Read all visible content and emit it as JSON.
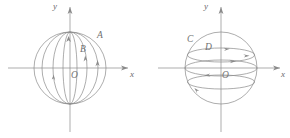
{
  "figure": {
    "background_color": "#ffffff",
    "stroke_color": "#8a8a8a",
    "label_color": "#6f6f6f",
    "panels": [
      {
        "id": "left-panel",
        "description": "sphere-with-vertical-meridian-arcs",
        "center": {
          "x": 70,
          "y": 68
        },
        "radius": 36,
        "axes": {
          "y_label": "y",
          "x_label": "x",
          "origin_label": "O"
        },
        "point_labels": [
          {
            "name": "A",
            "text": "A",
            "x": 97,
            "y": 35
          },
          {
            "name": "B",
            "text": "B",
            "x": 80,
            "y": 48
          }
        ],
        "origin_label_pos": {
          "x": 71,
          "y": 71
        }
      },
      {
        "id": "right-panel",
        "description": "sphere-with-horizontal-latitude-circles",
        "center": {
          "x": 221,
          "y": 68
        },
        "radius": 36,
        "axes": {
          "y_label": "y",
          "x_label": "x",
          "origin_label": "O"
        },
        "point_labels": [
          {
            "name": "C",
            "text": "C",
            "x": 188,
            "y": 39
          },
          {
            "name": "D",
            "text": "D",
            "x": 205,
            "y": 47
          }
        ],
        "origin_label_pos": {
          "x": 222,
          "y": 71
        }
      }
    ]
  }
}
